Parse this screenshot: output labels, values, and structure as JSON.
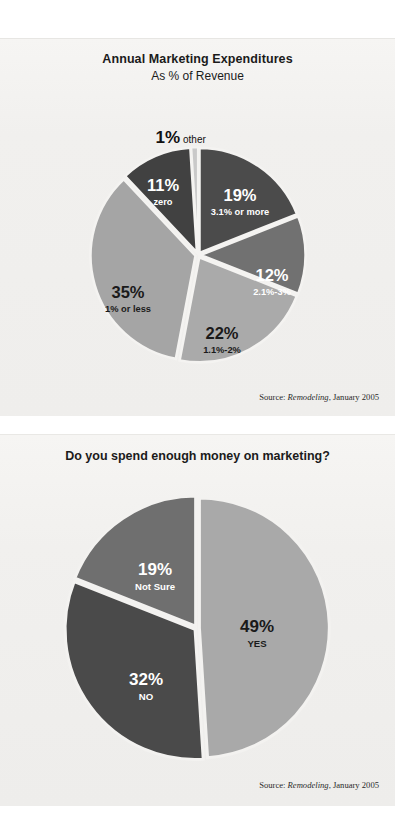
{
  "charts": [
    {
      "id": "annual-marketing-expenditures",
      "title": "Annual Marketing Expenditures",
      "subtitle": "As % of Revenue",
      "source_prefix": "Source: ",
      "source_italic": "Remodeling",
      "source_suffix": ", January 2005"
    },
    {
      "id": "spend-enough-on-marketing",
      "title": "Do you spend enough money on marketing?",
      "source_prefix": "Source: ",
      "source_italic": "Remodeling",
      "source_suffix": ", January 2005"
    }
  ],
  "labels": {
    "c1": {
      "s0": {
        "value": "19%",
        "name": "3.1% or more"
      },
      "s1": {
        "value": "12%",
        "name": "2.1%-3%"
      },
      "s2": {
        "value": "22%",
        "name": "1.1%-2%"
      },
      "s3": {
        "value": "35%",
        "name": "1% or less"
      },
      "s4": {
        "value": "11%",
        "name": "zero"
      },
      "s5": {
        "value": "1%",
        "name": "other"
      }
    },
    "c2": {
      "s0": {
        "value": "49%",
        "name": "YES"
      },
      "s1": {
        "value": "32%",
        "name": "NO"
      },
      "s2": {
        "value": "19%",
        "name": "Not Sure"
      }
    }
  },
  "chart_data": [
    {
      "type": "pie",
      "title": "Annual Marketing Expenditures",
      "subtitle": "As % of Revenue",
      "units": "percent",
      "legend": "none",
      "start_angle_deg": 0,
      "direction": "clockwise",
      "source": "Source: Remodeling, January 2005",
      "categories": [
        "3.1% or more",
        "2.1%-3%",
        "1.1%-2%",
        "1% or less",
        "zero",
        "other"
      ],
      "values": [
        19,
        12,
        22,
        35,
        11,
        1
      ],
      "labels": [
        "19%",
        "12%",
        "22%",
        "35%",
        "11%",
        "1%"
      ],
      "colors": [
        "#4b4b4b",
        "#717171",
        "#aaaaaa",
        "#a5a5a5",
        "#414141",
        "#c9c9c9"
      ],
      "label_text_colors": [
        "#ffffff",
        "#ffffff",
        "#1a1a1a",
        "#1a1a1a",
        "#ffffff",
        "#111111"
      ]
    },
    {
      "type": "pie",
      "title": "Do you spend enough money on marketing?",
      "units": "percent",
      "legend": "none",
      "start_angle_deg": 0,
      "direction": "clockwise",
      "source": "Source: Remodeling, January 2005",
      "categories": [
        "YES",
        "NO",
        "Not Sure"
      ],
      "values": [
        49,
        32,
        19
      ],
      "labels": [
        "49%",
        "32%",
        "19%"
      ],
      "colors": [
        "#a9a9a9",
        "#4a4a4a",
        "#6f6f6f"
      ],
      "label_text_colors": [
        "#1a1a1a",
        "#ffffff",
        "#ffffff"
      ]
    }
  ]
}
